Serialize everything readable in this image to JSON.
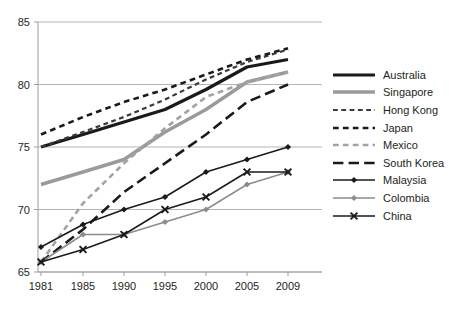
{
  "chart_data": {
    "type": "line",
    "title": "",
    "xlabel": "",
    "ylabel": "",
    "x": [
      1981,
      1985,
      1990,
      1995,
      2000,
      2005,
      2009
    ],
    "xtick_labels": [
      "1981",
      "1985",
      "1990",
      "1995",
      "2000",
      "2005",
      "2009"
    ],
    "ytick_labels": [
      "65",
      "70",
      "75",
      "80",
      "85"
    ],
    "yticks": [
      65,
      70,
      75,
      80,
      85
    ],
    "ylim": [
      65,
      85
    ],
    "grid": "horizontal",
    "legend_position": "right",
    "series": [
      {
        "name": "Australia",
        "label": "Australia",
        "color": "#1a1a1a",
        "style": "solid",
        "width": 3.2,
        "marker": "none",
        "values": [
          75.0,
          76.0,
          77.0,
          78.0,
          79.6,
          81.4,
          82.0
        ]
      },
      {
        "name": "Singapore",
        "label": "Singapore",
        "color": "#9a9a9a",
        "style": "solid",
        "width": 3.4,
        "marker": "none",
        "values": [
          72.0,
          73.0,
          74.0,
          76.2,
          78.0,
          80.2,
          81.0
        ]
      },
      {
        "name": "Hong Kong",
        "label": "Hong Kong",
        "color": "#3a3a3a",
        "style": "dashed",
        "width": 2.2,
        "marker": "none",
        "values": [
          75.0,
          76.2,
          77.4,
          78.8,
          80.4,
          81.8,
          82.8
        ]
      },
      {
        "name": "Japan",
        "label": "Japan",
        "color": "#1a1a1a",
        "style": "dashed",
        "width": 2.6,
        "marker": "none",
        "values": [
          76.0,
          77.4,
          78.6,
          79.6,
          80.8,
          82.0,
          82.9
        ]
      },
      {
        "name": "Mexico",
        "label": "Mexico",
        "color": "#a3a3a3",
        "style": "dashed",
        "width": 2.6,
        "marker": "none",
        "values": [
          65.8,
          70.5,
          73.7,
          76.5,
          79.0,
          80.2,
          81.0
        ]
      },
      {
        "name": "South Korea",
        "label": "South Korea",
        "color": "#1a1a1a",
        "style": "long-dash",
        "width": 2.6,
        "marker": "none",
        "values": [
          65.8,
          68.4,
          71.4,
          73.7,
          76.0,
          78.6,
          80.0
        ]
      },
      {
        "name": "Malaysia",
        "label": "Malaysia",
        "color": "#1a1a1a",
        "style": "solid",
        "width": 1.5,
        "marker": "diamond",
        "values": [
          67.0,
          68.8,
          70.0,
          71.0,
          73.0,
          74.0,
          75.0
        ]
      },
      {
        "name": "Colombia",
        "label": "Colombia",
        "color": "#8c8c8c",
        "style": "solid",
        "width": 1.5,
        "marker": "diamond",
        "values": [
          65.8,
          68.0,
          68.0,
          69.0,
          70.0,
          72.0,
          73.0
        ]
      },
      {
        "name": "China",
        "label": "China",
        "color": "#1a1a1a",
        "style": "solid",
        "width": 1.5,
        "marker": "x",
        "values": [
          65.8,
          66.8,
          68.0,
          70.0,
          71.0,
          73.0,
          73.0
        ]
      }
    ]
  },
  "colors": {
    "axis": "#9d9d9d",
    "grid": "#b5b5b5",
    "text": "#231f20",
    "background": "#ffffff"
  }
}
